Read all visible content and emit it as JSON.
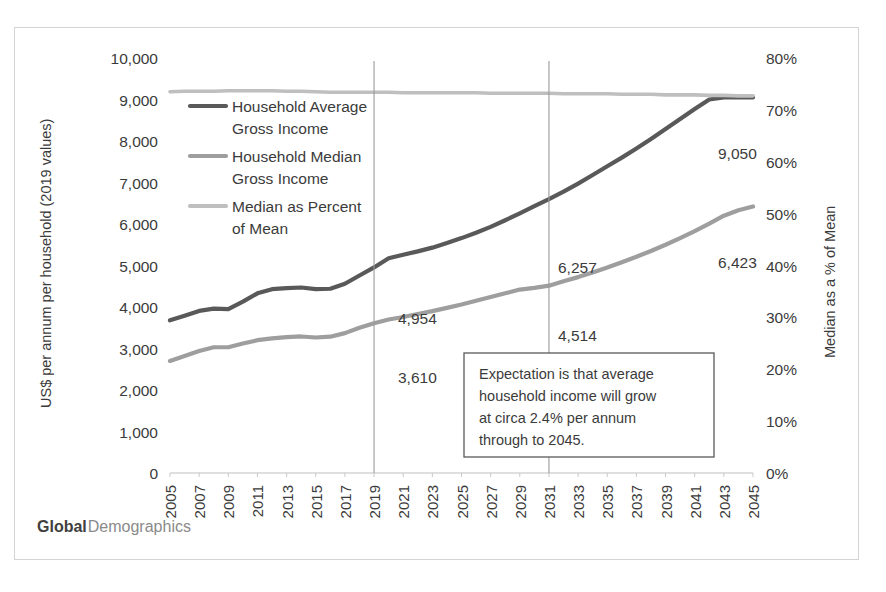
{
  "chart_data": {
    "type": "line",
    "title": "",
    "xlabel": "",
    "ylabel": "US$ per annum per household (2019 values)",
    "y2label": "Median as a % of Mean",
    "xlim": [
      2005,
      2045
    ],
    "ylim": [
      0,
      10000
    ],
    "y2lim": [
      0,
      0.8
    ],
    "grid": "vertical-markers-only",
    "legend_position": "inside-top-left",
    "x": [
      2005,
      2006,
      2007,
      2008,
      2009,
      2010,
      2011,
      2012,
      2013,
      2014,
      2015,
      2016,
      2017,
      2018,
      2019,
      2020,
      2021,
      2022,
      2023,
      2024,
      2025,
      2026,
      2027,
      2028,
      2029,
      2030,
      2031,
      2032,
      2033,
      2034,
      2035,
      2036,
      2037,
      2038,
      2039,
      2040,
      2041,
      2042,
      2043,
      2044,
      2045
    ],
    "xticklabels": [
      "2005",
      "2007",
      "2009",
      "2011",
      "2013",
      "2015",
      "2017",
      "2019",
      "2021",
      "2023",
      "2025",
      "2027",
      "2029",
      "2031",
      "2033",
      "2035",
      "2037",
      "2039",
      "2041",
      "2043",
      "2045"
    ],
    "yticklabels": [
      "10,000",
      "9,000",
      "8,000",
      "7,000",
      "6,000",
      "5,000",
      "4,000",
      "3,000",
      "2,000",
      "1,000",
      "0"
    ],
    "ytickvalues": [
      10000,
      9000,
      8000,
      7000,
      6000,
      5000,
      4000,
      3000,
      2000,
      1000,
      0
    ],
    "y2ticklabels": [
      "80%",
      "70%",
      "60%",
      "50%",
      "40%",
      "30%",
      "20%",
      "10%",
      "0%"
    ],
    "y2tickvalues": [
      0.8,
      0.7,
      0.6,
      0.5,
      0.4,
      0.3,
      0.2,
      0.1,
      0.0
    ],
    "series": [
      {
        "name": "Household Average Gross Income",
        "key": "average",
        "axis": "left",
        "color": "#595959",
        "width": 4.2,
        "values": [
          3680,
          3790,
          3905,
          3960,
          3950,
          4130,
          4330,
          4430,
          4455,
          4470,
          4430,
          4440,
          4560,
          4760,
          4954,
          5175,
          5260,
          5340,
          5430,
          5540,
          5660,
          5790,
          5930,
          6090,
          6257,
          6430,
          6600,
          6780,
          6975,
          7180,
          7390,
          7600,
          7820,
          8050,
          8290,
          8530,
          8770,
          9000,
          9050,
          9050,
          9050
        ]
      },
      {
        "name": "Household Median Gross Income",
        "key": "median",
        "axis": "left",
        "color": "#9e9e9e",
        "width": 4.2,
        "values": [
          2700,
          2820,
          2940,
          3030,
          3030,
          3120,
          3200,
          3245,
          3275,
          3290,
          3265,
          3285,
          3370,
          3500,
          3610,
          3700,
          3760,
          3830,
          3900,
          3980,
          4060,
          4150,
          4240,
          4330,
          4420,
          4460,
          4514,
          4620,
          4720,
          4830,
          4950,
          5080,
          5210,
          5350,
          5500,
          5660,
          5830,
          6010,
          6200,
          6330,
          6423
        ]
      },
      {
        "name": "Median as Percent of Mean",
        "key": "percent",
        "axis": "right",
        "color": "#bfbfbf",
        "width": 3.6,
        "values": [
          0.735,
          0.736,
          0.736,
          0.736,
          0.737,
          0.737,
          0.737,
          0.737,
          0.736,
          0.736,
          0.735,
          0.734,
          0.734,
          0.734,
          0.734,
          0.734,
          0.733,
          0.733,
          0.733,
          0.733,
          0.733,
          0.733,
          0.732,
          0.732,
          0.732,
          0.732,
          0.732,
          0.731,
          0.731,
          0.731,
          0.731,
          0.73,
          0.73,
          0.73,
          0.729,
          0.729,
          0.729,
          0.728,
          0.728,
          0.727,
          0.727
        ]
      }
    ],
    "data_labels": [
      {
        "id": "avg-2019",
        "text": "4,954",
        "x": 383,
        "y": 296
      },
      {
        "id": "med-2019",
        "text": "3,610",
        "x": 383,
        "y": 355
      },
      {
        "id": "avg-2031",
        "text": "6,257",
        "x": 543,
        "y": 245
      },
      {
        "id": "med-2031",
        "text": "4,514",
        "x": 543,
        "y": 313
      },
      {
        "id": "avg-2045",
        "text": "9,050",
        "x": 703,
        "y": 131
      },
      {
        "id": "med-2045",
        "text": "6,423",
        "x": 703,
        "y": 240
      }
    ],
    "markers": [
      {
        "id": "marker-2019",
        "year": 2019
      },
      {
        "id": "marker-2031",
        "year": 2031
      }
    ],
    "annotations": [
      {
        "id": "growth-note",
        "lines": [
          "Expectation is that average",
          "household income will grow",
          "at circa 2.4% per annum",
          "through to 2045."
        ]
      }
    ]
  },
  "legend": {
    "items": [
      {
        "label_line1": "Household Average",
        "label_line2": "Gross Income",
        "color": "#595959"
      },
      {
        "label_line1": "Household Median",
        "label_line2": "Gross Income",
        "color": "#9e9e9e"
      },
      {
        "label_line1": "Median as Percent",
        "label_line2": "of Mean",
        "color": "#bfbfbf"
      }
    ]
  },
  "brand": {
    "bold_part": "Global",
    "light_part": "Demographics"
  },
  "colors": {
    "frame_border": "#d4d4d4",
    "axis_line": "#bfbfbf",
    "text": "#3b3b3b",
    "note_border": "#595959"
  }
}
